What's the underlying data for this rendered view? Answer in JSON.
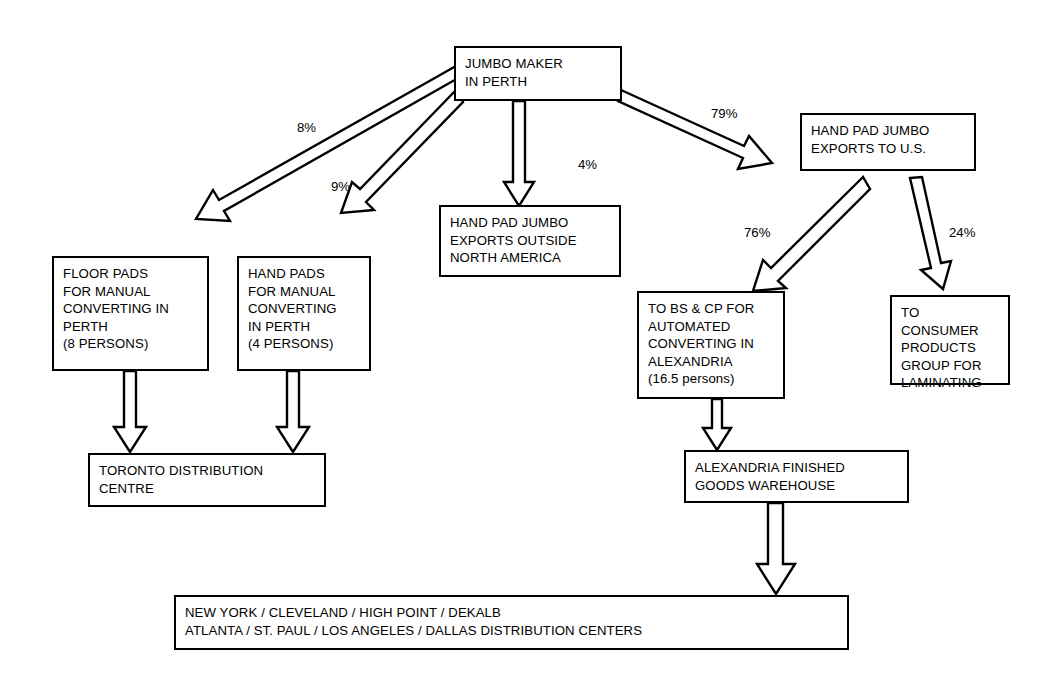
{
  "diagram": {
    "background_color": "#ffffff",
    "line_color": "#000000",
    "nodes": [
      {
        "id": "jumbo_maker",
        "label": "JUMBO MAKER\nIN PERTH"
      },
      {
        "id": "hand_pad_us",
        "label": "HAND PAD JUMBO\nEXPORTS TO U.S."
      },
      {
        "id": "hand_pad_outside",
        "label": "HAND PAD JUMBO\nEXPORTS OUTSIDE\nNORTH AMERICA"
      },
      {
        "id": "floor_pads",
        "label": "FLOOR PADS\nFOR MANUAL\nCONVERTING IN\nPERTH\n(8 PERSONS)"
      },
      {
        "id": "hand_pads",
        "label": "HAND PADS\nFOR MANUAL\nCONVERTING\nIN PERTH\n (4 PERSONS)"
      },
      {
        "id": "bs_cp",
        "label": "TO BS & CP FOR\nAUTOMATED\nCONVERTING IN\nALEXANDRIA\n(16.5 persons)"
      },
      {
        "id": "consumer_products",
        "label": "TO CONSUMER\nPRODUCTS\nGROUP FOR\nLAMINATING"
      },
      {
        "id": "toronto",
        "label": "TORONTO DISTRIBUTION\nCENTRE"
      },
      {
        "id": "alexandria",
        "label": "ALEXANDRIA FINISHED\nGOODS WAREHOUSE"
      },
      {
        "id": "distribution",
        "label": "NEW YORK / CLEVELAND / HIGH POINT / DEKALB\nATLANTA / ST. PAUL / LOS ANGELES / DALLAS  DISTRIBUTION CENTERS"
      }
    ],
    "edge_labels": [
      {
        "id": "pct_floor_pads",
        "value": "8%"
      },
      {
        "id": "pct_hand_pads",
        "value": "9%"
      },
      {
        "id": "pct_outside",
        "value": "4%"
      },
      {
        "id": "pct_us",
        "value": "79%"
      },
      {
        "id": "pct_bs_cp",
        "value": "76%"
      },
      {
        "id": "pct_consumer",
        "value": "24%"
      }
    ]
  }
}
